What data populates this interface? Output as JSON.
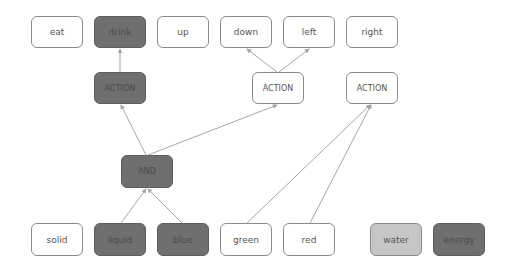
{
  "diagram": {
    "type": "node-link graph",
    "colors": {
      "white": "#ffffff",
      "dark": "#6f6f6f",
      "light": "#c6c6c6",
      "edge": "#a6a6a6"
    },
    "nodes": [
      {
        "id": "eat",
        "label": "eat",
        "style": "white",
        "x": 31,
        "y": 16,
        "w": 52,
        "h": 32
      },
      {
        "id": "drink",
        "label": "drink",
        "style": "dark",
        "x": 94,
        "y": 16,
        "w": 52,
        "h": 32
      },
      {
        "id": "up",
        "label": "up",
        "style": "white",
        "x": 157,
        "y": 16,
        "w": 52,
        "h": 32
      },
      {
        "id": "down",
        "label": "down",
        "style": "white",
        "x": 220,
        "y": 16,
        "w": 52,
        "h": 32
      },
      {
        "id": "left",
        "label": "left",
        "style": "white",
        "x": 283,
        "y": 16,
        "w": 52,
        "h": 32
      },
      {
        "id": "right",
        "label": "right",
        "style": "white",
        "x": 346,
        "y": 16,
        "w": 52,
        "h": 32
      },
      {
        "id": "action1",
        "label": "ACTION",
        "style": "dark",
        "x": 94,
        "y": 72,
        "w": 52,
        "h": 32
      },
      {
        "id": "action2",
        "label": "ACTION",
        "style": "white",
        "x": 252,
        "y": 72,
        "w": 52,
        "h": 32
      },
      {
        "id": "action3",
        "label": "ACTION",
        "style": "white",
        "x": 346,
        "y": 72,
        "w": 52,
        "h": 32
      },
      {
        "id": "and",
        "label": "AND",
        "style": "dark",
        "x": 121,
        "y": 155,
        "w": 52,
        "h": 33
      },
      {
        "id": "solid",
        "label": "solid",
        "style": "white",
        "x": 31,
        "y": 223,
        "w": 52,
        "h": 33
      },
      {
        "id": "liquid",
        "label": "liquid",
        "style": "dark",
        "x": 94,
        "y": 223,
        "w": 52,
        "h": 33
      },
      {
        "id": "blue",
        "label": "blue",
        "style": "dark",
        "x": 157,
        "y": 223,
        "w": 52,
        "h": 33
      },
      {
        "id": "green",
        "label": "green",
        "style": "white",
        "x": 220,
        "y": 223,
        "w": 52,
        "h": 33
      },
      {
        "id": "red",
        "label": "red",
        "style": "white",
        "x": 283,
        "y": 223,
        "w": 52,
        "h": 33
      },
      {
        "id": "water",
        "label": "water",
        "style": "light",
        "x": 370,
        "y": 223,
        "w": 52,
        "h": 33
      },
      {
        "id": "energy",
        "label": "energy",
        "style": "dark",
        "x": 433,
        "y": 223,
        "w": 52,
        "h": 33
      }
    ],
    "edges": [
      {
        "from": "action1",
        "to": "drink"
      },
      {
        "from": "action2",
        "to": "down"
      },
      {
        "from": "action2",
        "to": "left"
      },
      {
        "from": "and",
        "to": "action1"
      },
      {
        "from": "and",
        "to": "action2"
      },
      {
        "from": "liquid",
        "to": "and"
      },
      {
        "from": "blue",
        "to": "and"
      },
      {
        "from": "green",
        "to": "action3"
      },
      {
        "from": "red",
        "to": "action3"
      }
    ]
  },
  "labels": {
    "eat": "eat",
    "drink": "drink",
    "up": "up",
    "down": "down",
    "left": "left",
    "right": "right",
    "action1": "ACTION",
    "action2": "ACTION",
    "action3": "ACTION",
    "and": "AND",
    "solid": "solid",
    "liquid": "liquid",
    "blue": "blue",
    "green": "green",
    "red": "red",
    "water": "water",
    "energy": "energy"
  }
}
